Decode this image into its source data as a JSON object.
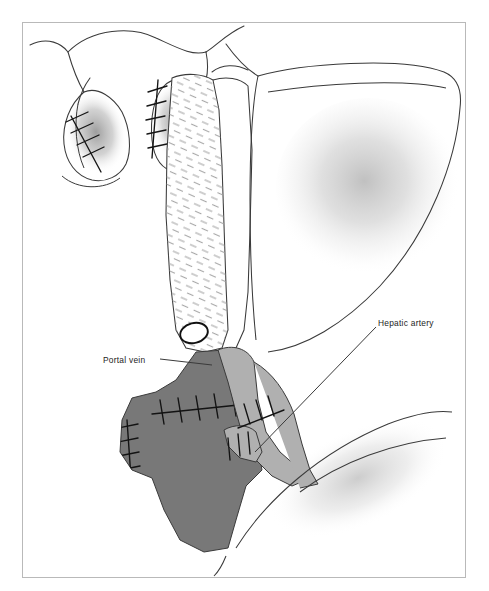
{
  "figure": {
    "border_color": "#b9b9b9",
    "background": "#ffffff",
    "line_color": "#3a3a3a"
  },
  "labels": [
    {
      "id": "portal-vein",
      "text": "Portal vein",
      "x": 103,
      "y": 355,
      "leader": {
        "x1": 160,
        "y1": 359,
        "x2": 212,
        "y2": 365
      }
    },
    {
      "id": "hepatic-artery",
      "text": "Hepatic artery",
      "x": 378,
      "y": 318,
      "leader": {
        "x1": 376,
        "y1": 327,
        "x2": 255,
        "y2": 452
      }
    }
  ],
  "structures": [
    {
      "name": "left-lobe-stump",
      "type": "outline",
      "shading": "ellipse-gray",
      "sutures": "diagonal-cross-stitch"
    },
    {
      "name": "right-lobe-stump",
      "type": "outline",
      "shading": "ellipse-gray",
      "sutures": "vertical-cross-stitch"
    },
    {
      "name": "central-duct-segment",
      "type": "outline",
      "texture": "hatched-stipple"
    },
    {
      "name": "liver-lobe",
      "type": "outline",
      "shading": "radial-gray"
    },
    {
      "name": "bile-duct-stump",
      "type": "oval",
      "fill": "#ffffff"
    },
    {
      "name": "portal-vein-graft",
      "type": "filled",
      "fill": "#787878",
      "sutures": "anastomosis-stitch"
    },
    {
      "name": "hepatic-artery-graft",
      "type": "filled",
      "fill": "#b0b0b0",
      "sutures": "anastomosis-stitch"
    },
    {
      "name": "duodenum",
      "type": "outline",
      "shading": "soft-gray"
    }
  ],
  "colors": {
    "portal_vein_fill": "#787878",
    "hepatic_artery_fill": "#b0b0b0",
    "outline": "#3a3a3a",
    "suture": "#1a1a1a",
    "shadow": "#9a9a9a"
  }
}
